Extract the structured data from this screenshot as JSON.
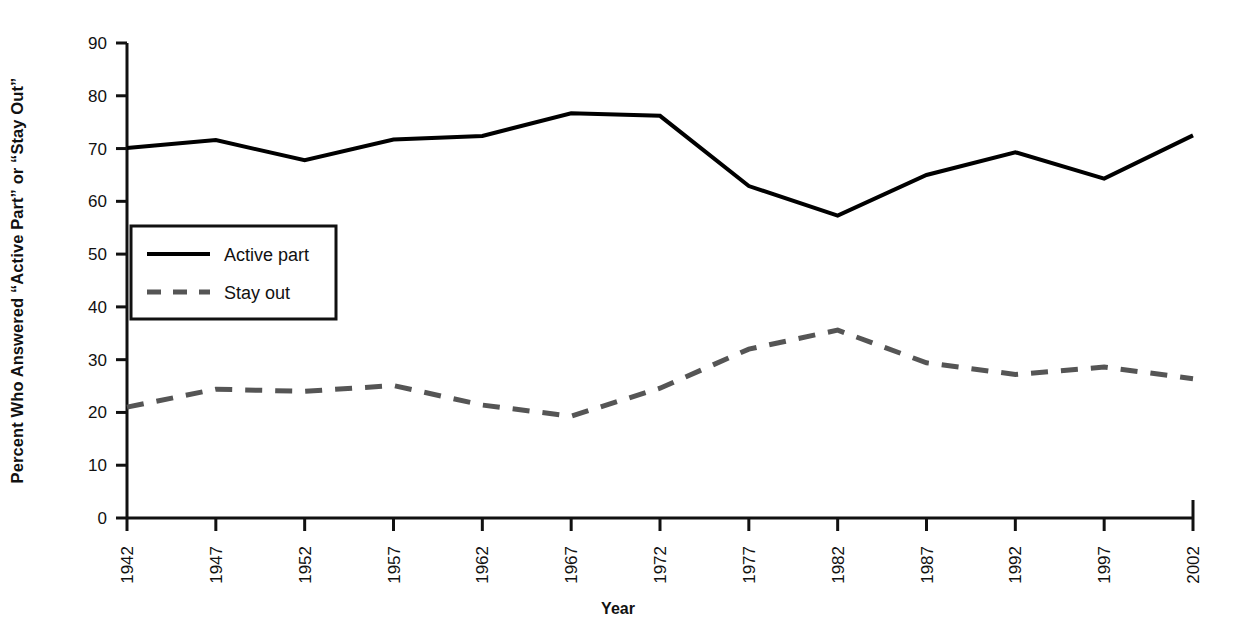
{
  "chart_data": {
    "type": "line",
    "title": "",
    "xlabel": "Year",
    "ylabel": "Percent Who Answered “Active Part” or “Stay Out”",
    "x": [
      1942,
      1947,
      1952,
      1957,
      1962,
      1967,
      1972,
      1977,
      1982,
      1987,
      1992,
      1997,
      2002
    ],
    "xticklabels": [
      "1942",
      "1947",
      "1952",
      "1957",
      "1962",
      "1967",
      "1972",
      "1977",
      "1982",
      "1987",
      "1992",
      "1997",
      "2002"
    ],
    "yticklabels": [
      "0",
      "10",
      "20",
      "30",
      "40",
      "50",
      "60",
      "70",
      "80",
      "90"
    ],
    "yticks": [
      0,
      10,
      20,
      30,
      40,
      50,
      60,
      70,
      80,
      90
    ],
    "ylim": [
      0,
      90
    ],
    "xlim": [
      1942,
      2002
    ],
    "grid": false,
    "legend_position": "upper left, inside axes",
    "series": [
      {
        "name": "Active part",
        "style": "solid",
        "color": "#000000",
        "linewidth": 4,
        "values": [
          70.1,
          71.6,
          67.8,
          71.7,
          72.4,
          76.7,
          76.2,
          62.9,
          57.3,
          65.0,
          69.3,
          64.3,
          72.5
        ]
      },
      {
        "name": "Stay out",
        "style": "dashed",
        "color": "#555555",
        "linewidth": 5,
        "values": [
          21.0,
          24.4,
          24.0,
          25.1,
          21.4,
          19.3,
          24.6,
          32.0,
          35.6,
          29.4,
          27.2,
          28.6,
          26.4
        ]
      }
    ]
  },
  "legend": {
    "items": [
      {
        "label": "Active part"
      },
      {
        "label": "Stay out"
      }
    ]
  },
  "axes": {
    "y_axis_title": "Percent Who Answered “Active Part” or “Stay Out”",
    "x_axis_title": "Year"
  }
}
